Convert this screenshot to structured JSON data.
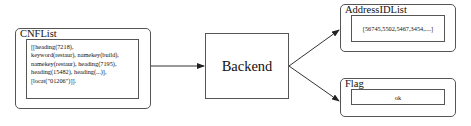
{
  "diagram": {
    "cnflist": {
      "title": "CNFList",
      "content": "[[heading(7218),\nkeyword(restaur), namekey(build),\nnamekey(restaur), heading(7195),\nheading(15482), heading(...)],\n[locat(\"01206\")]]."
    },
    "backend": {
      "label": "Backend"
    },
    "address_id_list": {
      "title": "AddressIDList",
      "content": "[56745,5502,5467,3454,....]"
    },
    "flag": {
      "title": "Flag",
      "content": "ok"
    },
    "edges": [
      {
        "from": "CNFList",
        "to": "Backend"
      },
      {
        "from": "Backend",
        "to": "AddressIDList"
      },
      {
        "from": "Backend",
        "to": "Flag"
      }
    ],
    "colors": {
      "stroke": "#555555",
      "text": "#111111",
      "background": "#ffffff"
    }
  }
}
